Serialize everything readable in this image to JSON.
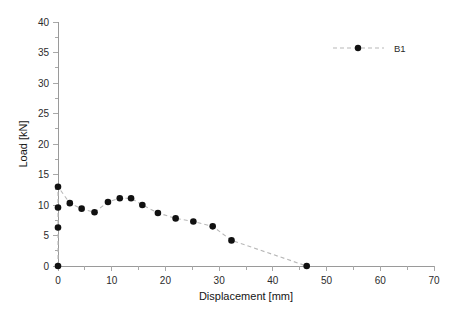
{
  "chart_data": {
    "type": "scatter",
    "title": "",
    "xlabel": "Displacement [mm]",
    "ylabel": "Load [kN]",
    "xlim": [
      0,
      70
    ],
    "ylim": [
      0,
      40
    ],
    "xticks": [
      0,
      10,
      20,
      30,
      40,
      50,
      60,
      70
    ],
    "yticks": [
      0,
      5,
      10,
      15,
      20,
      25,
      30,
      35,
      40
    ],
    "xtick_labels": [
      "0",
      "10",
      "20",
      "30",
      "40",
      "50",
      "60",
      "70"
    ],
    "ytick_labels": [
      "0",
      "5",
      "10",
      "15",
      "20",
      "25",
      "30",
      "35",
      "40"
    ],
    "minor_tick_step_x": 5,
    "minor_tick_step_y": 5,
    "grid": false,
    "legend_position": "top-right",
    "series": [
      {
        "name": "B1",
        "marker": "circle",
        "marker_color": "#111111",
        "line_color": "#b8b8b8",
        "line_style": "dashed",
        "x": [
          0,
          0,
          0,
          0,
          2.2,
          4.4,
          6.8,
          9.3,
          11.5,
          13.6,
          15.7,
          18.6,
          21.9,
          25.2,
          28.8,
          32.3,
          46.3
        ],
        "y": [
          0,
          6.3,
          9.6,
          13.0,
          10.3,
          9.4,
          8.8,
          10.5,
          11.1,
          11.1,
          10.0,
          8.7,
          7.8,
          7.3,
          6.5,
          4.2,
          0.0
        ]
      }
    ]
  },
  "legend": {
    "entries": [
      {
        "label": "B1"
      }
    ]
  },
  "axes": {
    "x_title": "Displacement [mm]",
    "y_title": "Load [kN]"
  }
}
